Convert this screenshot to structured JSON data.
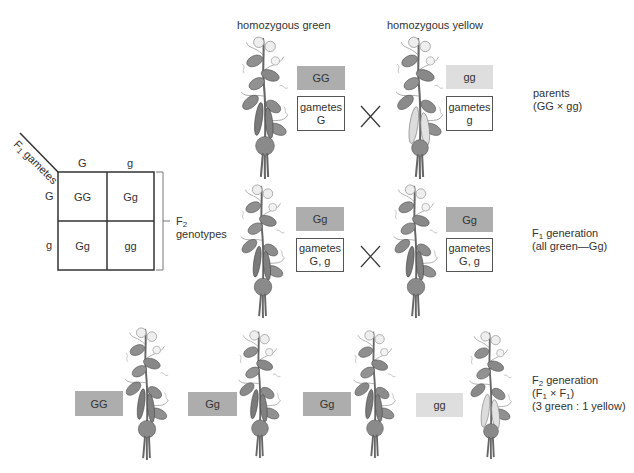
{
  "titles": {
    "green": "homozygous green",
    "yellow": "homozygous yellow"
  },
  "parents": {
    "left": {
      "genotype": "GG",
      "gametes_label": "gametes",
      "gametes": "G",
      "phenotype": "green"
    },
    "right": {
      "genotype": "gg",
      "gametes_label": "gametes",
      "gametes": "g",
      "phenotype": "yellow"
    },
    "cross_symbol": "cross-icon",
    "label": {
      "line1": "parents",
      "line2": "(GG × gg)"
    }
  },
  "f1": {
    "left": {
      "genotype": "Gg",
      "gametes_label": "gametes",
      "gametes": "G, g"
    },
    "right": {
      "genotype": "Gg",
      "gametes_label": "gametes",
      "gametes": "G, g"
    },
    "cross_symbol": "cross-icon",
    "label": {
      "prefix": "F",
      "sub": "1",
      "suffix": " generation",
      "line2": "(all green—Gg)"
    }
  },
  "punnett": {
    "header": {
      "prefix": "F",
      "sub": "1",
      "suffix": " gametes"
    },
    "col_headers": [
      "G",
      "g"
    ],
    "row_headers": [
      "G",
      "g"
    ],
    "cells": [
      [
        "GG",
        "Gg"
      ],
      [
        "Gg",
        "gg"
      ]
    ],
    "bracket_label": {
      "prefix": "F",
      "sub": "2",
      "line2": "genotypes"
    }
  },
  "f2": {
    "offspring": [
      {
        "genotype": "GG",
        "phenotype": "green"
      },
      {
        "genotype": "Gg",
        "phenotype": "green"
      },
      {
        "genotype": "Gg",
        "phenotype": "green"
      },
      {
        "genotype": "gg",
        "phenotype": "yellow"
      }
    ],
    "label": {
      "prefix": "F",
      "sub": "2",
      "suffix": " generation",
      "line2_a": "(F",
      "line2_sub1": "1",
      "line2_x": " × F",
      "line2_sub2": "1",
      "line2_b": ")",
      "line3": "(3 green : 1 yellow)"
    }
  },
  "colors": {
    "dominant_box": "#adadad",
    "recessive_box": "#dedede",
    "line": "#333333"
  }
}
